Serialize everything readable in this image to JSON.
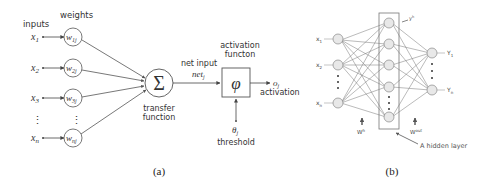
{
  "panel_a": {
    "label": "(a)",
    "inputs_label": "inputs",
    "weights_label": "weights",
    "inputs": [
      "x",
      "x",
      "x",
      "x"
    ],
    "input_subs": [
      "1",
      "2",
      "3",
      "n"
    ],
    "weights": [
      "w",
      "w",
      "w",
      "w"
    ],
    "weight_subs": [
      "1j",
      "2j",
      "3j",
      "nj"
    ],
    "sum_symbol": "Σ",
    "transfer_label_1": "transfer",
    "transfer_label_2": "function",
    "net_input_label": "net input",
    "net_symbol": "net",
    "net_sub": "j",
    "activation_function_label_1": "activation",
    "activation_function_label_2": "functon",
    "phi_symbol": "φ",
    "output_symbol": "o",
    "output_sub": "j",
    "activation_label": "activation",
    "threshold_symbol": "θ",
    "threshold_sub": "j",
    "threshold_label": "threshold",
    "vdots": "⋮"
  },
  "panel_b": {
    "label": "(b)",
    "inputs": [
      "x",
      "x",
      "x"
    ],
    "input_subs": [
      "1",
      "2",
      "n"
    ],
    "outputs": [
      "Y",
      "Y"
    ],
    "output_subs": [
      "1",
      "n"
    ],
    "hidden_node_label": "y",
    "hidden_node_sup": "h",
    "w_hidden": "W",
    "w_hidden_sup": "h",
    "w_out": "W",
    "w_out_sup": "out",
    "hidden_layer_label": "A hidden layer"
  },
  "colors": {
    "line": "#555555",
    "node_fill_b": "#e8e8e8",
    "text": "#333333"
  }
}
